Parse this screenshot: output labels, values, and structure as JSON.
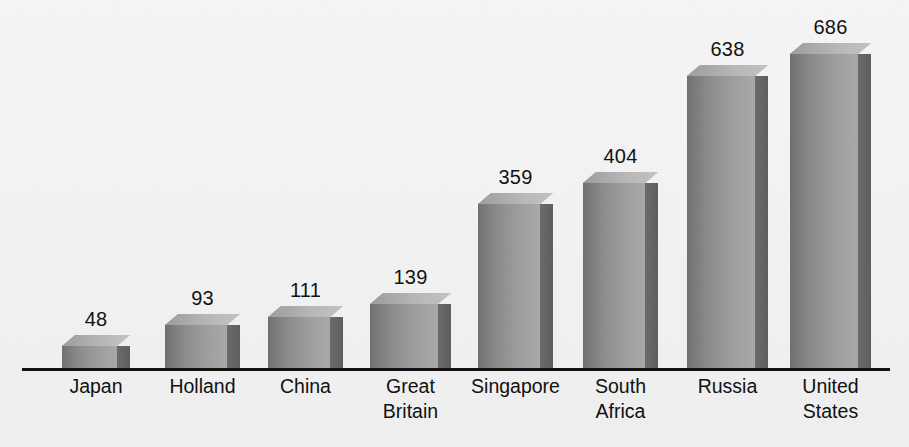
{
  "chart_data": {
    "type": "bar",
    "title": "",
    "subtitle": "",
    "xlabel": "",
    "ylabel": "",
    "categories": [
      "Japan",
      "Holland",
      "China",
      "Great\nBritain",
      "Singapore",
      "South\nAfrica",
      "Russia",
      "United\nStates"
    ],
    "values": [
      48,
      93,
      111,
      139,
      359,
      404,
      638,
      686
    ],
    "value_labels": [
      "48",
      "93",
      "111",
      "139",
      "359",
      "404",
      "638",
      "686"
    ],
    "ylim": [
      0,
      686
    ],
    "grid": false,
    "legend": false,
    "legend_position": "none",
    "style_3d": true,
    "axis_line": true
  },
  "colors": {
    "background": "#f2f2f2",
    "axis": "#111111",
    "bar_front_dark": "#6f6f6f",
    "bar_front_light": "#a8a8a8",
    "bar_side": "#636363",
    "bar_top": "#b8b8b8",
    "label_text": "#121212"
  },
  "bars": [
    {
      "category": "Japan",
      "label": "Japan",
      "value": 48,
      "value_text": "48",
      "left": 62,
      "width": 55
    },
    {
      "category": "Holland",
      "label": "Holland",
      "value": 93,
      "value_text": "93",
      "left": 165,
      "width": 62
    },
    {
      "category": "China",
      "label": "China",
      "value": 111,
      "value_text": "111",
      "left": 268,
      "width": 62
    },
    {
      "category": "Great Britain",
      "label": "Great\nBritain",
      "value": 139,
      "value_text": "139",
      "left": 370,
      "width": 68
    },
    {
      "category": "Singapore",
      "label": "Singapore",
      "value": 359,
      "value_text": "359",
      "left": 478,
      "width": 62
    },
    {
      "category": "South Africa",
      "label": "South\nAfrica",
      "value": 404,
      "value_text": "404",
      "left": 583,
      "width": 62
    },
    {
      "category": "Russia",
      "label": "Russia",
      "value": 638,
      "value_text": "638",
      "left": 687,
      "width": 68
    },
    {
      "category": "United States",
      "label": "United\nStates",
      "value": 686,
      "value_text": "686",
      "left": 790,
      "width": 68
    }
  ],
  "geometry": {
    "baseline_y": 368,
    "axis_left": 22,
    "axis_width": 868,
    "depth_x": 13,
    "depth_y": 11,
    "px_per_unit": 0.4577
  }
}
